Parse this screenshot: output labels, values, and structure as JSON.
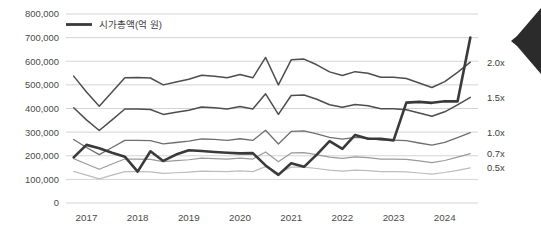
{
  "chart_data": {
    "type": "line",
    "title": "",
    "xlabel": "",
    "ylabel": "",
    "ylim": [
      0,
      800000
    ],
    "grid": true,
    "legend_position": "top-left",
    "legend": [
      "시가총액(억 원)"
    ],
    "y_ticks": [
      "0",
      "100,000",
      "200,000",
      "300,000",
      "400,000",
      "500,000",
      "600,000",
      "700,000",
      "800,000"
    ],
    "y_tick_values": [
      0,
      100000,
      200000,
      300000,
      400000,
      500000,
      600000,
      700000,
      800000
    ],
    "x_ticks": [
      "2017",
      "2018",
      "2019",
      "2020",
      "2021",
      "2022",
      "2023",
      "2024"
    ],
    "x_tick_values": [
      2017,
      2018,
      2019,
      2020,
      2021,
      2022,
      2023,
      2024
    ],
    "band_labels": [
      "2.0x",
      "1.5x",
      "1.0x",
      "0.7x",
      "0.5x"
    ],
    "x": [
      2016.75,
      2017.0,
      2017.25,
      2017.5,
      2017.75,
      2018.0,
      2018.25,
      2018.5,
      2018.75,
      2019.0,
      2019.25,
      2019.5,
      2019.75,
      2020.0,
      2020.25,
      2020.5,
      2020.75,
      2021.0,
      2021.25,
      2021.5,
      2021.75,
      2022.0,
      2022.25,
      2022.5,
      2022.75,
      2023.0,
      2023.25,
      2023.5,
      2023.75,
      2024.0,
      2024.25,
      2024.5
    ],
    "series": [
      {
        "name": "시가총액(억 원)",
        "style": "thick-dark",
        "color": "#3a3a3a",
        "width": 2.6,
        "values": [
          193000,
          246000,
          232000,
          213000,
          196000,
          133000,
          219000,
          178000,
          205000,
          223000,
          220000,
          216000,
          213000,
          210000,
          211000,
          159000,
          119000,
          168000,
          153000,
          205000,
          262000,
          229000,
          288000,
          272000,
          272000,
          265000,
          425000,
          428000,
          424000,
          431000,
          430000,
          700000
        ]
      },
      {
        "name": "2.0x band",
        "style": "thin-dark",
        "color": "#4d4d4d",
        "width": 1.5,
        "values": [
          537000,
          470000,
          410000,
          470000,
          530000,
          531000,
          529000,
          500000,
          512000,
          524000,
          541000,
          537000,
          530000,
          544000,
          530000,
          616000,
          500000,
          606000,
          609000,
          585000,
          555000,
          540000,
          556000,
          549000,
          532000,
          532000,
          527000,
          508000,
          489000,
          514000,
          553000,
          596000
        ]
      },
      {
        "name": "1.5x band",
        "style": "thin-dark",
        "color": "#4d4d4d",
        "width": 1.5,
        "values": [
          403000,
          352000,
          307000,
          352000,
          398000,
          398000,
          396000,
          375000,
          384000,
          393000,
          406000,
          403000,
          398000,
          408000,
          398000,
          462000,
          375000,
          455000,
          457000,
          439000,
          416000,
          405000,
          417000,
          412000,
          399000,
          399000,
          395000,
          381000,
          367000,
          386000,
          415000,
          447000
        ]
      },
      {
        "name": "1.0x band",
        "style": "medium",
        "color": "#6e6e6e",
        "width": 1.3,
        "values": [
          269000,
          235000,
          205000,
          235000,
          265000,
          265000,
          264000,
          250000,
          256000,
          262000,
          271000,
          269000,
          265000,
          272000,
          265000,
          308000,
          250000,
          303000,
          305000,
          293000,
          278000,
          270000,
          278000,
          275000,
          266000,
          266000,
          264000,
          254000,
          245000,
          257000,
          277000,
          298000
        ]
      },
      {
        "name": "0.7x band",
        "style": "light",
        "color": "#9a9a9a",
        "width": 1.2,
        "values": [
          188000,
          165000,
          143000,
          165000,
          186000,
          186000,
          185000,
          175000,
          179000,
          183000,
          190000,
          188000,
          186000,
          190000,
          186000,
          216000,
          175000,
          212000,
          213000,
          205000,
          194000,
          189000,
          195000,
          192000,
          186000,
          186000,
          185000,
          178000,
          171000,
          180000,
          194000,
          209000
        ]
      },
      {
        "name": "0.5x band",
        "style": "lighter",
        "color": "#bcbcbc",
        "width": 1.2,
        "values": [
          134000,
          118000,
          102000,
          118000,
          133000,
          133000,
          132000,
          125000,
          128000,
          131000,
          135000,
          134000,
          133000,
          136000,
          133000,
          154000,
          125000,
          152000,
          152000,
          146000,
          139000,
          135000,
          139000,
          137000,
          133000,
          133000,
          132000,
          127000,
          122000,
          129000,
          138000,
          149000
        ]
      }
    ],
    "colors": {
      "market_cap_line": "#3a3a3a",
      "band_2_0x": "#4d4d4d",
      "band_1_5x": "#4d4d4d",
      "band_1_0x": "#6e6e6e",
      "band_0_7x": "#9a9a9a",
      "band_0_5x": "#bcbcbc",
      "gridline": "#d4d4d4",
      "axis_text": "#4a4a4a",
      "corner_chevron": "#2b2b2b"
    }
  },
  "decor": {
    "chevron_name": "left-chevron-decoration"
  }
}
